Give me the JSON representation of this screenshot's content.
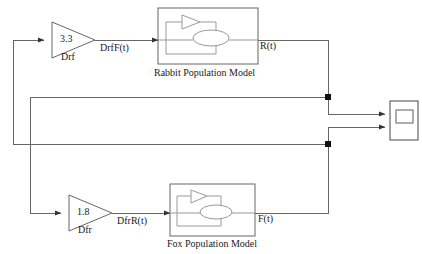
{
  "diagram": {
    "colors": {
      "line": "#555555",
      "line_dark": "#333333",
      "text": "#1a1a1a",
      "background": "#ffffff",
      "junction": "#111111"
    },
    "blocks": [
      {
        "id": "gain-drf",
        "type": "gain",
        "value": "3.3",
        "name": "Drf",
        "output_signal": "DrfF(t)"
      },
      {
        "id": "rabbit-model",
        "type": "subsystem",
        "caption": "Rabbit Population Model",
        "output_signal": "R(t)"
      },
      {
        "id": "gain-dfr",
        "type": "gain",
        "value": "1.8",
        "name": "Dfr",
        "output_signal": "DfrR(t)"
      },
      {
        "id": "fox-model",
        "type": "subsystem",
        "caption": "Fox Population Model",
        "output_signal": "F(t)"
      },
      {
        "id": "scope",
        "type": "scope",
        "caption": ""
      }
    ],
    "labels": {
      "gain_top_value": "3.3",
      "gain_top_name": "Drf",
      "signal_top": "DrfF(t)",
      "subsystem_top_caption": "Rabbit Population Model",
      "output_top": "R(t)",
      "gain_bottom_value": "1.8",
      "gain_bottom_name": "Dfr",
      "signal_bottom": "DfrR(t)",
      "subsystem_bottom_caption": "Fox Population Model",
      "output_bottom": "F(t)"
    }
  }
}
